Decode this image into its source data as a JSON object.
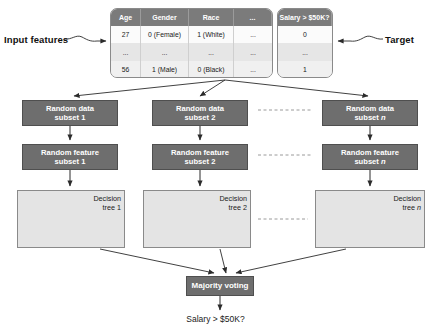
{
  "annotations": {
    "input_features": "Input features",
    "target": "Target"
  },
  "table": {
    "feature_headers": [
      "Age",
      "Gender",
      "Race",
      "..."
    ],
    "target_header": "Salary > $50K?",
    "rows": [
      {
        "age": "27",
        "gender": "0 (Female)",
        "race": "1 (White)",
        "more": "...",
        "target": "0"
      },
      {
        "age": "...",
        "gender": "...",
        "race": "...",
        "more": "...",
        "target": "..."
      },
      {
        "age": "56",
        "gender": "1 (Male)",
        "race": "0 (Black)",
        "more": "...",
        "target": "1"
      }
    ]
  },
  "pipeline": {
    "data_subsets": [
      {
        "line1": "Random data",
        "line2": "subset 1"
      },
      {
        "line1": "Random data",
        "line2": "subset 2"
      },
      {
        "line1": "Random data",
        "line2": "subset ",
        "italic": "n"
      }
    ],
    "feature_subsets": [
      {
        "line1": "Random feature",
        "line2": "subset 1"
      },
      {
        "line1": "Random feature",
        "line2": "subset 2"
      },
      {
        "line1": "Random feature",
        "line2": "subset ",
        "italic": "n"
      }
    ],
    "trees": [
      {
        "line1": "Decision",
        "line2": "tree 1"
      },
      {
        "line1": "Decision",
        "line2": "tree 2"
      },
      {
        "line1": "Decision",
        "line2": "tree ",
        "italic": "n"
      }
    ],
    "majority_voting": "Majority voting",
    "final_output": "Salary > $50K?"
  },
  "colors": {
    "dark_box": "#6e6e6e",
    "header_row": "#7b7b7b",
    "tree_panel": "#e4e4e4",
    "node": "#777777",
    "stroke": "#2b2b2b"
  }
}
